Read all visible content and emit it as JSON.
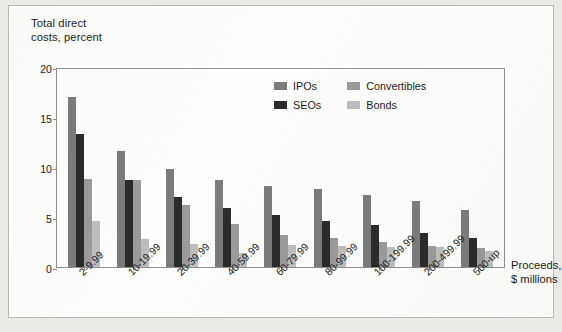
{
  "chart_data": {
    "type": "bar",
    "title": "",
    "ylabel": "Total direct\ncosts, percent",
    "xlabel": "Proceeds,\n$ millions",
    "ylim": [
      0,
      20
    ],
    "yticks": [
      0,
      5,
      10,
      15,
      20
    ],
    "grid": false,
    "legend_position": "top-right-inside",
    "categories": [
      "2-9.99",
      "10-19.99",
      "20-39.99",
      "40-59.99",
      "60-79.99",
      "80-99.99",
      "100-199.99",
      "200-499.99",
      "500-up"
    ],
    "series": [
      {
        "name": "IPOs",
        "color": "#7b7b7b",
        "values": [
          17.0,
          11.6,
          9.8,
          8.7,
          8.1,
          7.8,
          7.2,
          6.6,
          5.7
        ]
      },
      {
        "name": "SEOs",
        "color": "#2b2b2b",
        "values": [
          13.3,
          8.7,
          7.0,
          5.9,
          5.2,
          4.6,
          4.2,
          3.4,
          2.9
        ]
      },
      {
        "name": "Convertibles",
        "color": "#9a9a9a",
        "values": [
          8.8,
          8.7,
          6.2,
          4.3,
          3.2,
          2.9,
          2.5,
          2.1,
          1.9
        ]
      },
      {
        "name": "Bonds",
        "color": "#bdbdbd",
        "values": [
          4.6,
          2.8,
          2.3,
          1.4,
          2.2,
          2.1,
          2.0,
          2.0,
          1.6
        ]
      }
    ]
  },
  "footnote": ""
}
